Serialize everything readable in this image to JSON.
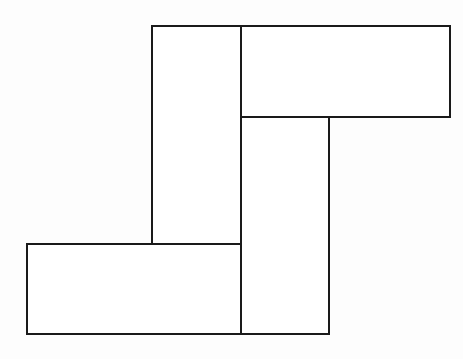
{
  "figure": {
    "title": "Pinwheel arrangement of four congruent rectangles",
    "background_color": "#fdfdfd",
    "stroke_color": "#1a1a1a",
    "fill_color": "#ffffff",
    "stroke_width": 2,
    "canvas": {
      "width": 463,
      "height": 359
    },
    "shape_count": 4,
    "shapes": [
      {
        "name": "rectangle-upper-left-vertical",
        "orientation": "vertical",
        "x": 152,
        "y": 26,
        "width": 89,
        "height": 218,
        "points": "152,26 241,26 241,244 152,244"
      },
      {
        "name": "rectangle-upper-right-horizontal",
        "orientation": "horizontal",
        "x": 241,
        "y": 26,
        "width": 209,
        "height": 91,
        "points": "241,26 450,26 450,117 241,117"
      },
      {
        "name": "rectangle-lower-right-vertical",
        "orientation": "vertical",
        "x": 241,
        "y": 117,
        "width": 88,
        "height": 217,
        "points": "241,117 329,117 329,334 241,334"
      },
      {
        "name": "rectangle-lower-left-horizontal",
        "orientation": "horizontal",
        "x": 27,
        "y": 244,
        "width": 214,
        "height": 90,
        "points": "27,244 241,244 241,334 27,334"
      }
    ]
  }
}
